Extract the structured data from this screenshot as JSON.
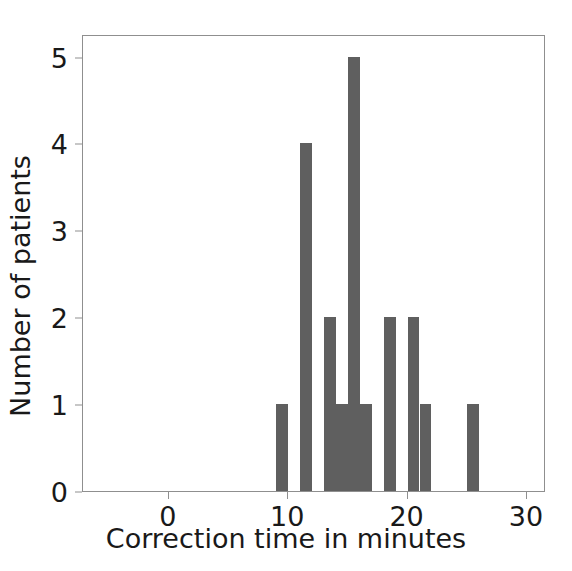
{
  "chart_data": {
    "type": "bar",
    "title": "",
    "subtitle": "",
    "xlabel": "Correction time in minutes",
    "ylabel": "Number of patients",
    "xlim": [
      -7.2,
      31.6
    ],
    "ylim": [
      0,
      5.26
    ],
    "xticks": [
      0,
      10,
      20,
      30
    ],
    "xtick_labels": [
      "0",
      "10",
      "20",
      "30"
    ],
    "yticks": [
      0,
      1,
      2,
      3,
      4,
      5
    ],
    "ytick_labels": [
      "0",
      "1",
      "2",
      "3",
      "4",
      "5"
    ],
    "grid": false,
    "legend": false,
    "bar_color": "#5f5f5f",
    "axis_color": "#8f8f8f",
    "text_color": "#191919",
    "background": "#ffffff",
    "histogram_note": "Histogram of correction time per patient, bin width 1 minute",
    "categories": [
      9,
      11,
      13,
      14,
      15,
      16,
      18,
      20,
      21,
      25
    ],
    "values": [
      1,
      4,
      2,
      1,
      5,
      1,
      2,
      2,
      1,
      1
    ],
    "bars": [
      {
        "bin_start": 9,
        "bin_end": 10,
        "value": 1
      },
      {
        "bin_start": 11,
        "bin_end": 12,
        "value": 4
      },
      {
        "bin_start": 13,
        "bin_end": 14,
        "value": 2
      },
      {
        "bin_start": 14,
        "bin_end": 15,
        "value": 1
      },
      {
        "bin_start": 15,
        "bin_end": 16,
        "value": 5
      },
      {
        "bin_start": 16,
        "bin_end": 17,
        "value": 1
      },
      {
        "bin_start": 18,
        "bin_end": 19,
        "value": 2
      },
      {
        "bin_start": 20,
        "bin_end": 21,
        "value": 2
      },
      {
        "bin_start": 21,
        "bin_end": 22,
        "value": 1
      },
      {
        "bin_start": 25,
        "bin_end": 26,
        "value": 1
      }
    ]
  }
}
